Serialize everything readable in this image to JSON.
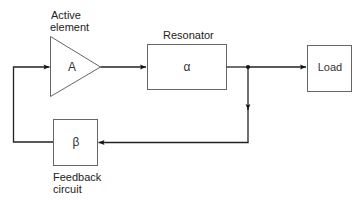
{
  "diagram": {
    "type": "block-diagram",
    "blocks": {
      "active_element": {
        "symbol": "A",
        "label_line1": "Active",
        "label_line2": "element",
        "shape": "triangle"
      },
      "resonator": {
        "symbol": "α",
        "label": "Resonator",
        "shape": "rectangle"
      },
      "load": {
        "symbol": "Load",
        "shape": "rectangle"
      },
      "feedback": {
        "symbol": "β",
        "label_line1": "Feedback",
        "label_line2": "circuit",
        "shape": "rectangle"
      }
    },
    "connections": [
      {
        "from": "active_element",
        "to": "resonator",
        "arrow": true
      },
      {
        "from": "resonator",
        "to": "junction",
        "arrow": false
      },
      {
        "from": "junction",
        "to": "load",
        "arrow": true
      },
      {
        "from": "junction",
        "to": "feedback",
        "arrow": true
      },
      {
        "from": "feedback",
        "to": "active_element",
        "arrow": true
      }
    ],
    "colors": {
      "line": "#222222",
      "box": "#555555",
      "background": "#ffffff"
    }
  }
}
